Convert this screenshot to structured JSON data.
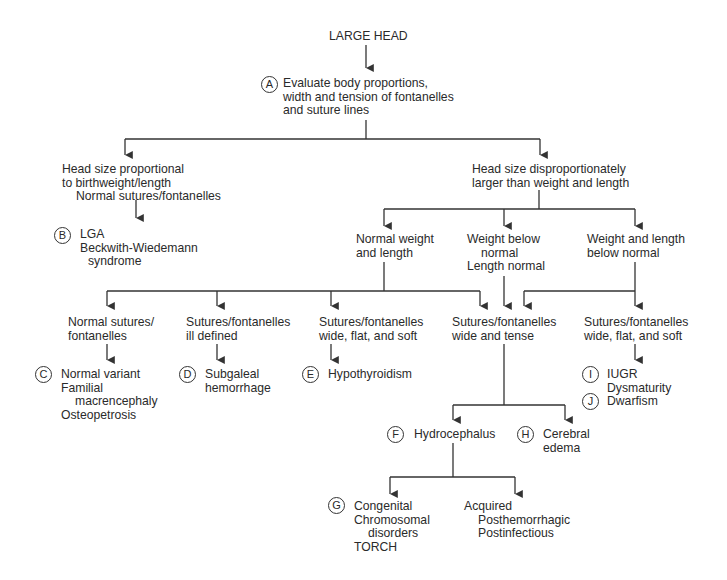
{
  "diagram": {
    "title": "LARGE HEAD",
    "step_a": {
      "badge": "A",
      "lines": [
        "Evaluate body proportions,",
        "width and tension of fontanelles",
        "and suture lines"
      ]
    },
    "proportional": {
      "lines": [
        "Head size proportional",
        "to birthweight/length",
        "Normal sutures/fontanelles"
      ]
    },
    "step_b": {
      "badge": "B",
      "lines": [
        "LGA",
        "Beckwith-Wiedemann",
        "syndrome"
      ]
    },
    "disproportional": {
      "lines": [
        "Head size disproportionately",
        "larger than weight and length"
      ]
    },
    "normal_weight": {
      "lines": [
        "Normal weight",
        "and length"
      ]
    },
    "weight_below": {
      "lines": [
        "Weight below",
        "normal",
        "Length normal"
      ]
    },
    "weight_length_below": {
      "lines": [
        "Weight and length",
        "below normal"
      ]
    },
    "normal_sutures": {
      "lines": [
        "Normal sutures/",
        "fontanelles"
      ]
    },
    "ill_defined": {
      "lines": [
        "Sutures/fontanelles",
        "ill defined"
      ]
    },
    "wide_flat_soft_1": {
      "lines": [
        "Sutures/fontanelles",
        "wide, flat, and soft"
      ]
    },
    "wide_tense": {
      "lines": [
        "Sutures/fontanelles",
        "wide and tense"
      ]
    },
    "wide_flat_soft_2": {
      "lines": [
        "Sutures/fontanelles",
        "wide, flat, and soft"
      ]
    },
    "step_c": {
      "badge": "C",
      "lines": [
        "Normal variant",
        "Familial",
        "macrencephaly",
        "Osteopetrosis"
      ]
    },
    "step_d": {
      "badge": "D",
      "lines": [
        "Subgaleal",
        "hemorrhage"
      ]
    },
    "step_e": {
      "badge": "E",
      "lines": [
        "Hypothyroidism"
      ]
    },
    "step_i": {
      "badge": "I",
      "lines": [
        "IUGR",
        "Dysmaturity"
      ]
    },
    "step_j": {
      "badge": "J",
      "lines": [
        "Dwarfism"
      ]
    },
    "step_f": {
      "badge": "F",
      "lines": [
        "Hydrocephalus"
      ]
    },
    "step_h": {
      "badge": "H",
      "lines": [
        "Cerebral",
        "edema"
      ]
    },
    "step_g": {
      "badge": "G",
      "lines": [
        "Congenital",
        "Chromosomal",
        "disorders",
        "TORCH"
      ]
    },
    "acquired": {
      "lines": [
        "Acquired",
        "Posthemorrhagic",
        "Postinfectious"
      ]
    },
    "colors": {
      "line": "#333333",
      "text": "#2a2a2a",
      "background": "#ffffff"
    }
  }
}
